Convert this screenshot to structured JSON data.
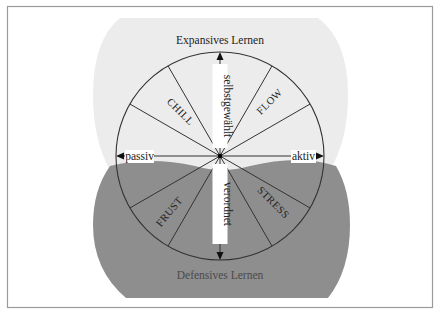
{
  "diagram": {
    "top_region": {
      "label": "Expansives Lernen",
      "color": "#ebebeb"
    },
    "bottom_region": {
      "label": "Defensives Lernen",
      "color": "#8e8e8e"
    },
    "axes": {
      "up": "selbstgewählt",
      "down": "verordnet",
      "left": "passiv",
      "right": "aktiv"
    },
    "sectors": {
      "upper_left": "CHILL",
      "upper_right": "FLOW",
      "lower_left": "FRUST",
      "lower_right": "STRESS"
    },
    "colors": {
      "frame": "#9a9a9a",
      "line": "#333333",
      "text": "#222222",
      "bottom_text": "#4a4a4a"
    }
  }
}
